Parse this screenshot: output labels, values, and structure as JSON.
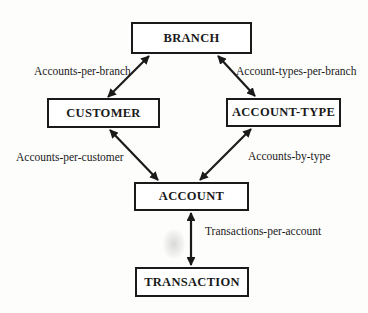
{
  "diagram": {
    "type": "entity-relationship",
    "entities": [
      {
        "id": "branch",
        "label": "BRANCH"
      },
      {
        "id": "customer",
        "label": "CUSTOMER"
      },
      {
        "id": "account_type",
        "label": "ACCOUNT-TYPE"
      },
      {
        "id": "account",
        "label": "ACCOUNT"
      },
      {
        "id": "transaction",
        "label": "TRANSACTION"
      }
    ],
    "relationships": [
      {
        "id": "accounts_per_branch",
        "label": "Accounts-per-branch",
        "from": "BRANCH",
        "to": "CUSTOMER"
      },
      {
        "id": "account_types_per_branch",
        "label": "Account-types-per-branch",
        "from": "BRANCH",
        "to": "ACCOUNT-TYPE"
      },
      {
        "id": "accounts_per_customer",
        "label": "Accounts-per-customer",
        "from": "CUSTOMER",
        "to": "ACCOUNT"
      },
      {
        "id": "accounts_by_type",
        "label": "Accounts-by-type",
        "from": "ACCOUNT-TYPE",
        "to": "ACCOUNT"
      },
      {
        "id": "transactions_per_account",
        "label": "Transactions-per-account",
        "from": "ACCOUNT",
        "to": "TRANSACTION"
      }
    ],
    "colors": {
      "line": "#1a1a1a",
      "background": "#ffffff"
    }
  }
}
